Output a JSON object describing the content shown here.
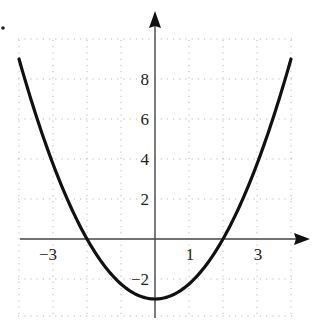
{
  "chart_data": {
    "type": "line",
    "title": "",
    "xlabel": "",
    "ylabel": "",
    "function": "y = 0.75x^2 - 3",
    "xlim": [
      -4.1,
      4.3
    ],
    "ylim": [
      -3.8,
      10
    ],
    "grid": true,
    "grid_style": "dotted",
    "x_tick_labels": [
      {
        "value": -3,
        "label": "−3"
      },
      {
        "value": 1,
        "label": "1"
      },
      {
        "value": 3,
        "label": "3"
      }
    ],
    "y_tick_labels": [
      {
        "value": 8,
        "label": "8"
      },
      {
        "value": 6,
        "label": "6"
      },
      {
        "value": 4,
        "label": "4"
      },
      {
        "value": 2,
        "label": "2"
      },
      {
        "value": -2,
        "label": "−2"
      }
    ],
    "series": [
      {
        "name": "parabola",
        "x": [
          -4,
          -3.5,
          -3,
          -2.5,
          -2,
          -1.5,
          -1,
          -0.5,
          0,
          0.5,
          1,
          1.5,
          2,
          2.5,
          3,
          3.5,
          4
        ],
        "y": [
          9,
          6.19,
          3.75,
          1.69,
          0,
          -1.31,
          -2.25,
          -2.81,
          -3,
          -2.81,
          -2.25,
          -1.31,
          0,
          1.69,
          3.75,
          6.19,
          9
        ]
      }
    ],
    "annotations": [
      "vertex at (0, -3)",
      "x-intercepts at (-2, 0) and (2, 0)"
    ]
  },
  "colors": {
    "curve": "#111111",
    "axis": "#444444",
    "grid": "#b8b8b8"
  }
}
